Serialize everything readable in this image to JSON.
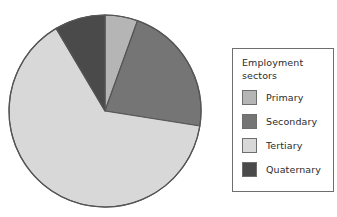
{
  "chart_data": {
    "type": "pie",
    "title": "",
    "legend_title_line1": "Employment",
    "legend_title_line2": "sectors",
    "legend_position": "right",
    "center": {
      "x": 105,
      "y": 111
    },
    "radius": 96,
    "start_angle_deg": 0,
    "direction": "clockwise",
    "outline_color": "#555555",
    "background": "#ffffff",
    "categories": [
      "Primary",
      "Secondary",
      "Tertiary",
      "Quaternary"
    ],
    "values": [
      5.5,
      22,
      64,
      8.5
    ],
    "value_unit": "percent",
    "colors": [
      "#b5b5b5",
      "#757575",
      "#d8d8d8",
      "#4a4a4a"
    ],
    "slices": [
      {
        "label": "Primary",
        "value": 5.5,
        "color": "#b5b5b5",
        "start_deg": 0,
        "end_deg": 19.8
      },
      {
        "label": "Secondary",
        "value": 22,
        "color": "#757575",
        "start_deg": 19.8,
        "end_deg": 99.0
      },
      {
        "label": "Tertiary",
        "value": 64,
        "color": "#d8d8d8",
        "start_deg": 99.0,
        "end_deg": 329.4
      },
      {
        "label": "Quaternary",
        "value": 8.5,
        "color": "#4a4a4a",
        "start_deg": 329.4,
        "end_deg": 360
      }
    ]
  },
  "legend": {
    "title_line1": "Employment",
    "title_line2": "sectors",
    "items": [
      {
        "label": "Primary",
        "color": "#b5b5b5"
      },
      {
        "label": "Secondary",
        "color": "#757575"
      },
      {
        "label": "Tertiary",
        "color": "#d8d8d8"
      },
      {
        "label": "Quaternary",
        "color": "#4a4a4a"
      }
    ]
  }
}
